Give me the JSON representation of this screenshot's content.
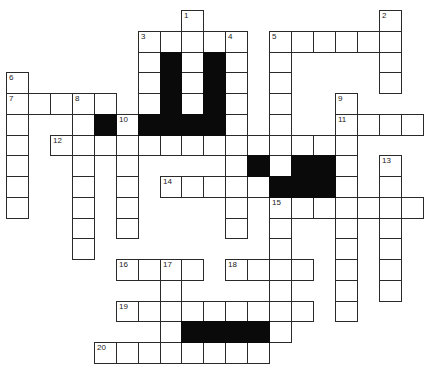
{
  "puzzle": {
    "type": "crossword",
    "grid_origin": {
      "x": 6,
      "y": 10
    },
    "cell_w": 21.93,
    "cell_h": 20.75,
    "colors": {
      "cell_bg": "#ffffff",
      "border": "#2a2a2a",
      "block": "#0a0a0a"
    },
    "words": [
      {
        "num": "1",
        "dir": "down",
        "col": 8,
        "row": 0,
        "len": 5
      },
      {
        "num": "2",
        "dir": "down",
        "col": 17,
        "row": 0,
        "len": 4
      },
      {
        "num": "3",
        "dir": "across",
        "col": 6,
        "row": 1,
        "len": 5
      },
      {
        "num": "3",
        "dir": "down",
        "col": 6,
        "row": 1,
        "len": 4
      },
      {
        "num": "4",
        "dir": "down",
        "col": 10,
        "row": 1,
        "len": 10
      },
      {
        "num": "5",
        "dir": "across",
        "col": 12,
        "row": 1,
        "len": 6
      },
      {
        "num": "5",
        "dir": "down",
        "col": 12,
        "row": 1,
        "len": 7
      },
      {
        "num": "6",
        "dir": "down",
        "col": 0,
        "row": 3,
        "len": 7
      },
      {
        "num": "7",
        "dir": "across",
        "col": 0,
        "row": 4,
        "len": 5
      },
      {
        "num": "8",
        "dir": "down",
        "col": 3,
        "row": 4,
        "len": 8
      },
      {
        "num": "9",
        "dir": "down",
        "col": 15,
        "row": 4,
        "len": 11
      },
      {
        "num": "10",
        "dir": "down",
        "col": 5,
        "row": 5,
        "len": 6
      },
      {
        "num": "11",
        "dir": "across",
        "col": 15,
        "row": 5,
        "len": 4
      },
      {
        "num": "12",
        "dir": "across",
        "col": 2,
        "row": 6,
        "len": 14
      },
      {
        "num": "13",
        "dir": "down",
        "col": 17,
        "row": 7,
        "len": 7
      },
      {
        "num": "14",
        "dir": "across",
        "col": 7,
        "row": 8,
        "len": 5
      },
      {
        "num": "15",
        "dir": "across",
        "col": 12,
        "row": 9,
        "len": 7
      },
      {
        "num": "15",
        "dir": "down",
        "col": 12,
        "row": 9,
        "len": 7
      },
      {
        "num": "16",
        "dir": "across",
        "col": 5,
        "row": 12,
        "len": 4
      },
      {
        "num": "17",
        "dir": "down",
        "col": 7,
        "row": 12,
        "len": 5
      },
      {
        "num": "18",
        "dir": "across",
        "col": 10,
        "row": 12,
        "len": 4
      },
      {
        "num": "19",
        "dir": "across",
        "col": 5,
        "row": 14,
        "len": 9
      },
      {
        "num": "20",
        "dir": "across",
        "col": 4,
        "row": 16,
        "len": 8
      }
    ],
    "blocks": [
      [
        7,
        2
      ],
      [
        7,
        3
      ],
      [
        7,
        4
      ],
      [
        9,
        2
      ],
      [
        9,
        3
      ],
      [
        9,
        4
      ],
      [
        4,
        5
      ],
      [
        6,
        5
      ],
      [
        7,
        5
      ],
      [
        8,
        5
      ],
      [
        9,
        5
      ],
      [
        11,
        7
      ],
      [
        13,
        7
      ],
      [
        14,
        7
      ],
      [
        12,
        8
      ],
      [
        13,
        8
      ],
      [
        14,
        8
      ],
      [
        8,
        15
      ],
      [
        9,
        15
      ],
      [
        10,
        15
      ],
      [
        11,
        15
      ]
    ]
  }
}
